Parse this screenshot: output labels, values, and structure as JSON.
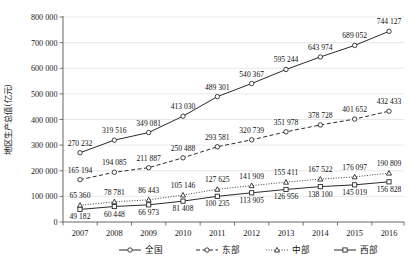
{
  "chart_data": {
    "type": "line",
    "title": "",
    "xlabel": "",
    "ylabel": "地区生产总值(亿元)",
    "categories": [
      "2007",
      "2008",
      "2009",
      "2010",
      "2011",
      "2012",
      "2013",
      "2014",
      "2015",
      "2016"
    ],
    "ylim": [
      0,
      800000
    ],
    "yticks": [
      0,
      100000,
      200000,
      300000,
      400000,
      500000,
      600000,
      700000,
      800000
    ],
    "ytick_labels": [
      "0",
      "100 000",
      "200 000",
      "300 000",
      "400 000",
      "500 000",
      "600 000",
      "700 000",
      "800 000"
    ],
    "grid": true,
    "legend_position": "bottom",
    "series": [
      {
        "name": "全国",
        "marker": "circle",
        "dash": "solid",
        "values": [
          270232,
          319516,
          349081,
          413030,
          489301,
          540367,
          595244,
          643974,
          689052,
          744127
        ],
        "labels": [
          "270 232",
          "319 516",
          "349 081",
          "413 030",
          "489 301",
          "540 367",
          "595 244",
          "643 974",
          "689 052",
          "744 127"
        ]
      },
      {
        "name": "东部",
        "marker": "circle",
        "dash": "dashed",
        "values": [
          165194,
          194085,
          211887,
          250488,
          293581,
          320739,
          351978,
          378728,
          401652,
          432433
        ],
        "labels": [
          "165 194",
          "194 085",
          "211 887",
          "250 488",
          "293 581",
          "320 739",
          "351 978",
          "378 728",
          "401 652",
          "432 433"
        ]
      },
      {
        "name": "中部",
        "marker": "triangle",
        "dash": "dotted",
        "values": [
          65360,
          78781,
          86443,
          105146,
          127625,
          141909,
          155411,
          167522,
          176097,
          190809
        ],
        "labels": [
          "65 360",
          "78 781",
          "86 443",
          "105 146",
          "127 625",
          "141 909",
          "155 411",
          "167 522",
          "176 097",
          "190 809"
        ]
      },
      {
        "name": "西部",
        "marker": "square",
        "dash": "solid",
        "values": [
          49182,
          60448,
          66973,
          81408,
          100235,
          113905,
          126956,
          138100,
          145019,
          156828
        ],
        "labels": [
          "49 182",
          "60 448",
          "66 973",
          "81 408",
          "100 235",
          "113 905",
          "126 956",
          "138 100",
          "145 019",
          "156 828"
        ]
      }
    ],
    "colors": {
      "line": "#2b2b2b",
      "grid": "#d8d8d8",
      "axis": "#555555",
      "background": "#ffffff"
    }
  },
  "legend": {
    "items": [
      {
        "label": "全国"
      },
      {
        "label": "东部"
      },
      {
        "label": "中部"
      },
      {
        "label": "西部"
      }
    ]
  }
}
